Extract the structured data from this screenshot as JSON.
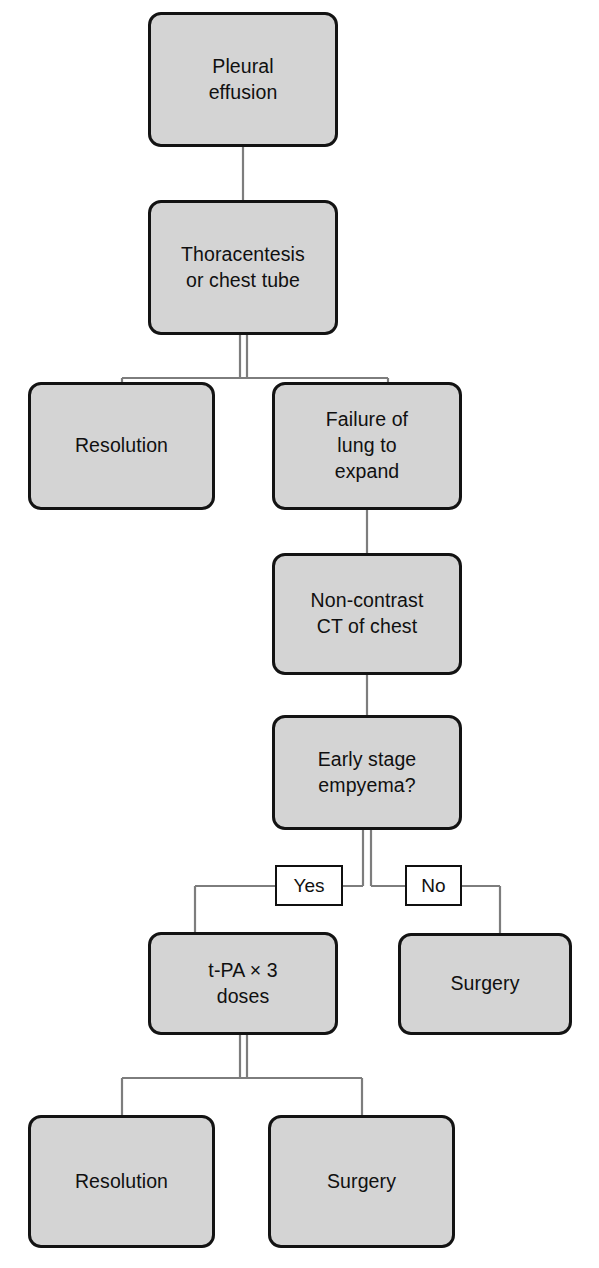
{
  "diagram": {
    "type": "flowchart",
    "colors": {
      "node_fill": "#d4d4d4",
      "node_stroke": "#131313",
      "edge_label_fill": "#ffffff",
      "connector": "#7d7d7d",
      "text": "#101010",
      "background": "#ffffff"
    },
    "nodes": [
      {
        "id": "pleural-effusion",
        "label": "Pleural\neffusion",
        "shape": "rounded-rect",
        "x": 148,
        "y": 12,
        "w": 190,
        "h": 135
      },
      {
        "id": "thoracentesis-or-chest-tube",
        "label": "Thoracentesis\nor chest tube",
        "shape": "rounded-rect",
        "x": 148,
        "y": 200,
        "w": 190,
        "h": 135
      },
      {
        "id": "resolution-upper",
        "label": "Resolution",
        "shape": "rounded-rect",
        "x": 28,
        "y": 382,
        "w": 187,
        "h": 128
      },
      {
        "id": "failure-of-lung-to-expand",
        "label": "Failure of\nlung to\nexpand",
        "shape": "rounded-rect",
        "x": 272,
        "y": 382,
        "w": 190,
        "h": 128
      },
      {
        "id": "non-contrast-ct-of-chest",
        "label": "Non-contrast\nCT of chest",
        "shape": "rounded-rect",
        "x": 272,
        "y": 553,
        "w": 190,
        "h": 122
      },
      {
        "id": "early-stage-empyema",
        "label": "Early stage\nempyema?",
        "shape": "rounded-rect",
        "x": 272,
        "y": 715,
        "w": 190,
        "h": 115
      },
      {
        "id": "t-pa-3-doses",
        "label": "t-PA × 3\ndoses",
        "shape": "rounded-rect",
        "x": 148,
        "y": 932,
        "w": 190,
        "h": 103
      },
      {
        "id": "surgery-middle",
        "label": "Surgery",
        "shape": "rounded-rect",
        "x": 398,
        "y": 933,
        "w": 174,
        "h": 102
      },
      {
        "id": "resolution-lower",
        "label": "Resolution",
        "shape": "rounded-rect",
        "x": 28,
        "y": 1115,
        "w": 187,
        "h": 133
      },
      {
        "id": "surgery-lower",
        "label": "Surgery",
        "shape": "rounded-rect",
        "x": 268,
        "y": 1115,
        "w": 187,
        "h": 133
      }
    ],
    "edge_labels": [
      {
        "id": "yes",
        "label": "Yes",
        "x": 275,
        "y": 865,
        "w": 68,
        "h": 41
      },
      {
        "id": "no",
        "label": "No",
        "x": 405,
        "y": 865,
        "w": 57,
        "h": 41
      }
    ],
    "edges": [
      {
        "from": "pleural-effusion",
        "to": "thoracentesis-or-chest-tube",
        "label": ""
      },
      {
        "from": "thoracentesis-or-chest-tube",
        "to": "resolution-upper",
        "label": ""
      },
      {
        "from": "thoracentesis-or-chest-tube",
        "to": "failure-of-lung-to-expand",
        "label": ""
      },
      {
        "from": "failure-of-lung-to-expand",
        "to": "non-contrast-ct-of-chest",
        "label": ""
      },
      {
        "from": "non-contrast-ct-of-chest",
        "to": "early-stage-empyema",
        "label": ""
      },
      {
        "from": "early-stage-empyema",
        "to": "t-pa-3-doses",
        "label": "Yes"
      },
      {
        "from": "early-stage-empyema",
        "to": "surgery-middle",
        "label": "No"
      },
      {
        "from": "t-pa-3-doses",
        "to": "resolution-lower",
        "label": ""
      },
      {
        "from": "t-pa-3-doses",
        "to": "surgery-lower",
        "label": ""
      }
    ]
  }
}
